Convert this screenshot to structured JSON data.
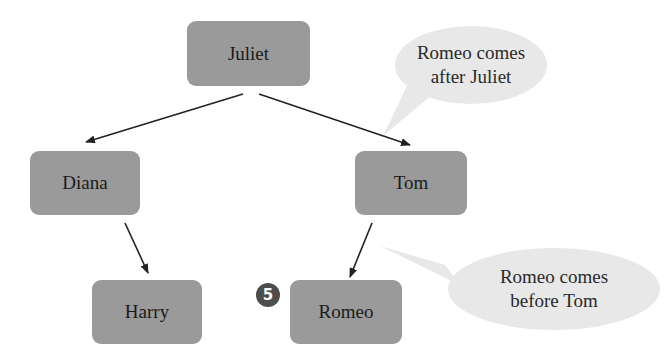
{
  "diagram": {
    "type": "binary-search-tree",
    "nodes": {
      "root": "Juliet",
      "left": "Diana",
      "right": "Tom",
      "left_left": "Harry",
      "right_left": "Romeo"
    },
    "edges": [
      {
        "from": "Juliet",
        "to": "Diana"
      },
      {
        "from": "Juliet",
        "to": "Tom"
      },
      {
        "from": "Diana",
        "to": "Harry"
      },
      {
        "from": "Tom",
        "to": "Romeo"
      }
    ],
    "callouts": {
      "top": {
        "line1": "Romeo comes",
        "line2": "after Juliet"
      },
      "bottom": {
        "line1": "Romeo comes",
        "line2": "before Tom"
      }
    },
    "step_badge": "5",
    "colors": {
      "node_fill": "#9a9a9a",
      "callout_fill": "#e8e8e8",
      "badge_fill": "#4d4d4d",
      "arrow": "#222222"
    }
  }
}
